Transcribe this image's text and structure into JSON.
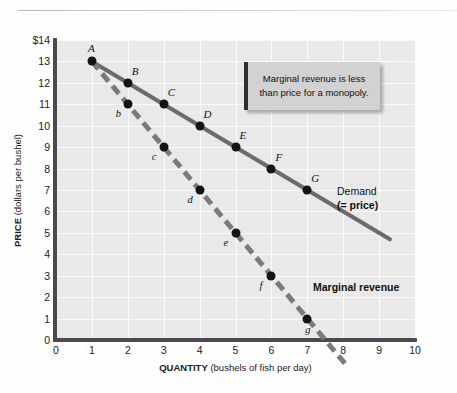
{
  "chart_data": {
    "type": "line",
    "title": "",
    "xlabel_bold": "QUANTITY",
    "xlabel_rest": " (bushels of fish per day)",
    "ylabel_bold": "PRICE",
    "ylabel_rest": " (dollars per bushel)",
    "xlim": [
      0,
      10
    ],
    "ylim": [
      0,
      14
    ],
    "xticks": [
      "0",
      "1",
      "2",
      "3",
      "4",
      "5",
      "6",
      "7",
      "8",
      "9",
      "10"
    ],
    "yticks": [
      "$14",
      "13",
      "12",
      "11",
      "10",
      "9",
      "8",
      "7",
      "6",
      "5",
      "4",
      "3",
      "2",
      "1",
      "0"
    ],
    "grid": true,
    "legend_position": "inline-right",
    "series": [
      {
        "name": "Demand (= price)",
        "style": "solid",
        "color": "#6b6b6b",
        "slope": -1,
        "x": [
          1,
          2,
          3,
          4,
          5,
          6,
          7
        ],
        "values": [
          13,
          12,
          11,
          10,
          9,
          8,
          7
        ],
        "point_labels": [
          "A",
          "B",
          "C",
          "D",
          "E",
          "F",
          "G"
        ],
        "extend_to": [
          9.3,
          4.7
        ]
      },
      {
        "name": "Marginal revenue",
        "style": "dashed",
        "color": "#7a7a7a",
        "slope": -2,
        "x": [
          1,
          2,
          3,
          4,
          5,
          6,
          7
        ],
        "values": [
          13,
          11,
          9,
          7,
          5,
          3,
          1
        ],
        "point_labels": [
          "A",
          "b",
          "c",
          "d",
          "e",
          "f",
          "g"
        ],
        "extend_to": [
          8.05,
          -1.1
        ]
      }
    ],
    "annotations": [
      {
        "id": "callout",
        "text": "Marginal revenue is less than price for a monopoly."
      }
    ]
  },
  "legend": {
    "demand_line1": "Demand",
    "demand_line2": "(= price)",
    "marginal_revenue": "Marginal revenue"
  },
  "colors": {
    "plot_background": "#e9e9e9",
    "gridline": "#fbfbfb",
    "axis": "#4a4a4a",
    "demand_line": "#6b6b6b",
    "mr_line": "#7a7a7a",
    "marker": "#141414",
    "callout_background": "#d2d2d2",
    "callout_border": "#2e2e2e"
  }
}
